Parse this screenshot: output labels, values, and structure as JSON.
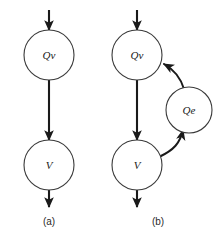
{
  "figure": {
    "width": 218,
    "height": 244,
    "background_color": "#ffffff",
    "line_color": "#1a1a1a",
    "node_stroke_color": "#3a3a3a",
    "node_fill_color": "#ffffff",
    "label_color": "#1a1a1a"
  },
  "panels": [
    {
      "id": "a",
      "caption": "(a)",
      "caption_x": 49,
      "caption_y": 222,
      "nodes": [
        {
          "id": "a-qv",
          "label": "Qv",
          "cx": 49,
          "cy": 55,
          "r": 25
        },
        {
          "id": "a-v",
          "label": "V",
          "cx": 49,
          "cy": 165,
          "r": 25
        }
      ],
      "edges": [
        {
          "id": "a-in",
          "type": "straight",
          "from": "external-top",
          "to": "a-qv",
          "x": 49,
          "y1": 10,
          "y2": 30,
          "arrowhead": "end"
        },
        {
          "id": "a-qv-v",
          "type": "straight",
          "from": "a-qv",
          "to": "a-v",
          "x": 49,
          "y1": 80,
          "y2": 140,
          "arrowhead": "end"
        },
        {
          "id": "a-out",
          "type": "straight",
          "from": "a-v",
          "to": "external-bottom",
          "x": 49,
          "y1": 190,
          "y2": 207,
          "arrowhead": "end"
        }
      ]
    },
    {
      "id": "b",
      "caption": "(b)",
      "caption_x": 158,
      "caption_y": 222,
      "nodes": [
        {
          "id": "b-qv",
          "label": "Qv",
          "cx": 137,
          "cy": 55,
          "r": 25
        },
        {
          "id": "b-v",
          "label": "V",
          "cx": 137,
          "cy": 165,
          "r": 25
        },
        {
          "id": "b-qe",
          "label": "Qe",
          "cx": 189,
          "cy": 110,
          "r": 23
        }
      ],
      "edges": [
        {
          "id": "b-in",
          "type": "straight",
          "from": "external-top",
          "to": "b-qv",
          "x": 137,
          "y1": 10,
          "y2": 30,
          "arrowhead": "end"
        },
        {
          "id": "b-qv-v",
          "type": "straight",
          "from": "b-qv",
          "to": "b-v",
          "x": 137,
          "y1": 80,
          "y2": 140,
          "arrowhead": "end"
        },
        {
          "id": "b-out",
          "type": "straight",
          "from": "b-v",
          "to": "external-bottom",
          "x": 137,
          "y1": 190,
          "y2": 207,
          "arrowhead": "end"
        },
        {
          "id": "b-v-qe",
          "type": "curve",
          "from": "b-v",
          "to": "b-qe",
          "arrowhead": "end"
        },
        {
          "id": "b-qe-qv",
          "type": "curve",
          "from": "b-qe",
          "to": "b-qv",
          "arrowhead": "end"
        }
      ]
    }
  ]
}
